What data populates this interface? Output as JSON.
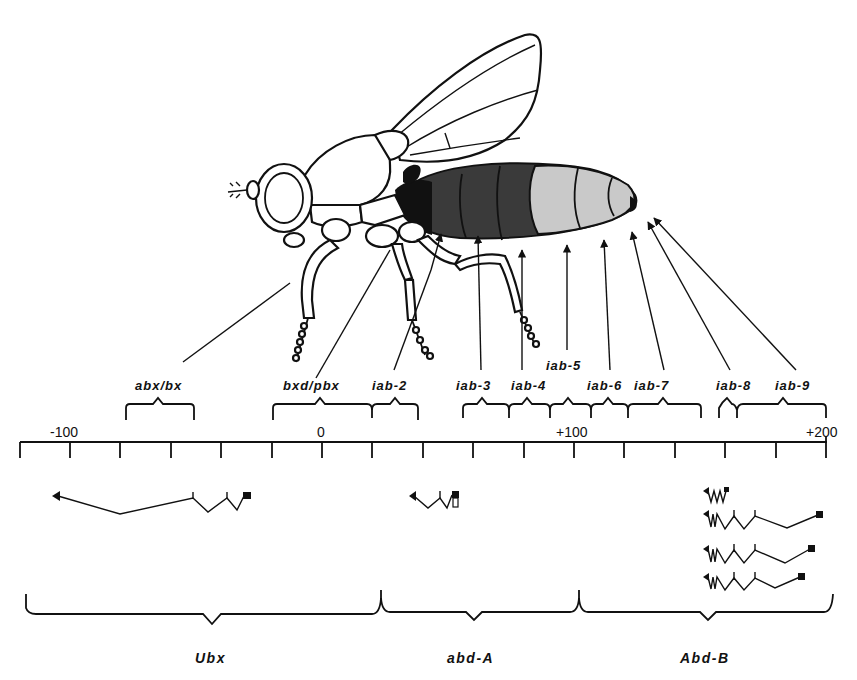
{
  "figure": {
    "colors": {
      "ink": "#111111",
      "dark_segments": "#3a3a3a",
      "light_segments": "#c9c9c9",
      "background": "#ffffff"
    }
  },
  "scale": {
    "unit_note": "kb",
    "tick_labels": [
      {
        "label": "-100",
        "value": -100
      },
      {
        "label": "0",
        "value": 0
      },
      {
        "label": "+100",
        "value": 100
      },
      {
        "label": "+200",
        "value": 200
      }
    ],
    "tick_interval": 20,
    "range": [
      -120,
      200
    ]
  },
  "regulatory_regions": [
    {
      "id": "abx-bx",
      "label": "abx/bx"
    },
    {
      "id": "bxd-pbx",
      "label": "bxd/pbx"
    },
    {
      "id": "iab-2",
      "label": "iab-2"
    },
    {
      "id": "iab-3",
      "label": "iab-3"
    },
    {
      "id": "iab-4",
      "label": "iab-4"
    },
    {
      "id": "iab-5",
      "label": "iab-5"
    },
    {
      "id": "iab-6",
      "label": "iab-6"
    },
    {
      "id": "iab-7",
      "label": "iab-7"
    },
    {
      "id": "iab-8",
      "label": "iab-8"
    },
    {
      "id": "iab-9",
      "label": "iab-9"
    }
  ],
  "genes": [
    {
      "id": "ubx",
      "label": "Ubx",
      "transcripts": 1
    },
    {
      "id": "abd-a",
      "label": "abd-A",
      "transcripts": 1
    },
    {
      "id": "abd-b",
      "label": "Abd-B",
      "transcripts": 4
    }
  ]
}
